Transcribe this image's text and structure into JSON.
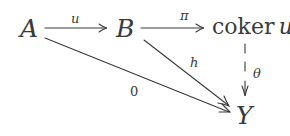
{
  "diagram": {
    "type": "commutative-diagram",
    "nodes": {
      "A": "A",
      "B": "B",
      "coker_word": "coker",
      "coker_var": "u",
      "Y": "Y"
    },
    "arrows": {
      "A_to_B": {
        "label": "u",
        "style": "solid"
      },
      "B_to_coker": {
        "label": "π",
        "style": "solid"
      },
      "B_to_Y": {
        "label": "h",
        "style": "solid"
      },
      "A_to_Y": {
        "label": "0",
        "style": "solid"
      },
      "coker_to_Y": {
        "label": "θ",
        "style": "dashed"
      }
    },
    "colors": {
      "ink": "#3a3a3a",
      "background": "#ffffff"
    }
  }
}
